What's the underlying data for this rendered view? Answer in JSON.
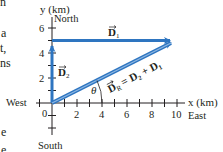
{
  "figure": {
    "axes": {
      "y_label": "y (km)",
      "x_label": "x (km)",
      "north": "North",
      "south": "South",
      "east": "East",
      "west": "West",
      "origin_label": "0",
      "x_ticks": [
        "2",
        "4",
        "6",
        "8",
        "10"
      ],
      "y_ticks": [
        "2",
        "4",
        "6"
      ]
    },
    "vectors": {
      "d1": {
        "label": "D",
        "subscript": "1"
      },
      "d2": {
        "label": "D",
        "subscript": "2"
      },
      "dr": {
        "label": "D",
        "subscript": "R",
        "equation": "= D₂ + D₁"
      }
    },
    "angle_label": "θ",
    "colors": {
      "vector": "#2e75c0",
      "axis": "#231f20"
    },
    "margin_fragments": [
      "n",
      "a",
      "t,",
      "ns",
      "e",
      "e"
    ]
  }
}
